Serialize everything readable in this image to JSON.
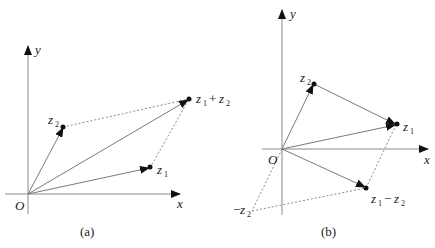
{
  "panels": [
    {
      "id": "a",
      "caption": "(a)",
      "axes": {
        "x_label": "x",
        "y_label": "y",
        "origin_label": "O"
      },
      "points": [
        {
          "name": "z1",
          "label": "z",
          "sub": "1",
          "suffix": ""
        },
        {
          "name": "z2",
          "label": "z",
          "sub": "2",
          "suffix": ""
        },
        {
          "name": "z1+z2",
          "label": "z",
          "sub": "1",
          "op": "+",
          "label2": "z",
          "sub2": "2"
        }
      ]
    },
    {
      "id": "b",
      "caption": "(b)",
      "axes": {
        "x_label": "x",
        "y_label": "y",
        "origin_label": "O"
      },
      "points": [
        {
          "name": "z1",
          "label": "z",
          "sub": "1"
        },
        {
          "name": "z2",
          "label": "z",
          "sub": "2"
        },
        {
          "name": "z1-z2",
          "label": "z",
          "sub": "1",
          "op": "−",
          "label2": "z",
          "sub2": "2"
        },
        {
          "name": "-z2",
          "prefix": "−",
          "label": "z",
          "sub": "2"
        }
      ]
    }
  ]
}
